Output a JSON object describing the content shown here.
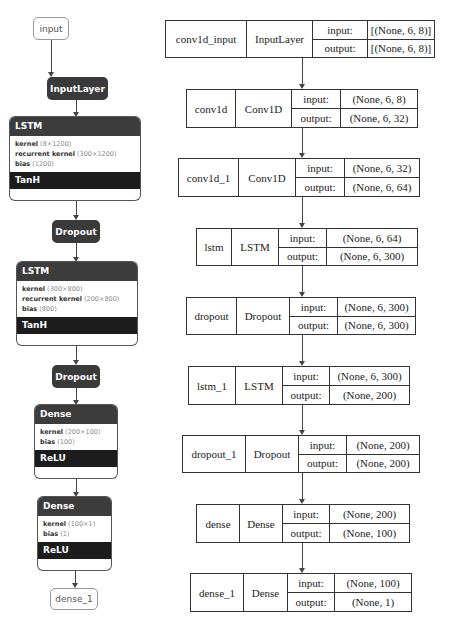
{
  "left_graph": {
    "input_node": "input",
    "input_layer": "InputLayer",
    "lstm1": {
      "title": "LSTM",
      "params": [
        {
          "name": "kernel",
          "shape": "(8×1200)"
        },
        {
          "name": "recurrent kernel",
          "shape": "(300×1200)"
        },
        {
          "name": "bias",
          "shape": "(1200)"
        }
      ],
      "activation": "TanH"
    },
    "dropout1": "Dropout",
    "lstm2": {
      "title": "LSTM",
      "params": [
        {
          "name": "kernel",
          "shape": "(300×800)"
        },
        {
          "name": "recurrent kernel",
          "shape": "(200×800)"
        },
        {
          "name": "bias",
          "shape": "(800)"
        }
      ],
      "activation": "TanH"
    },
    "dropout2": "Dropout",
    "dense1": {
      "title": "Dense",
      "params": [
        {
          "name": "kernel",
          "shape": "(200×100)"
        },
        {
          "name": "bias",
          "shape": "(100)"
        }
      ],
      "activation": "ReLU"
    },
    "dense2": {
      "title": "Dense",
      "params": [
        {
          "name": "kernel",
          "shape": "(100×1)"
        },
        {
          "name": "bias",
          "shape": "(1)"
        }
      ],
      "activation": "ReLU"
    },
    "output_node": "dense_1"
  },
  "keras_graph": [
    {
      "name": "conv1d_input",
      "type": "InputLayer",
      "input_label": "input:",
      "output_label": "output:",
      "input": "[(None, 6, 8)]",
      "output": "[(None, 6, 8)]"
    },
    {
      "name": "conv1d",
      "type": "Conv1D",
      "input_label": "input:",
      "output_label": "output:",
      "input": "(None, 6, 8)",
      "output": "(None, 6, 32)"
    },
    {
      "name": "conv1d_1",
      "type": "Conv1D",
      "input_label": "input:",
      "output_label": "output:",
      "input": "(None, 6, 32)",
      "output": "(None, 6, 64)"
    },
    {
      "name": "lstm",
      "type": "LSTM",
      "input_label": "input:",
      "output_label": "output:",
      "input": "(None, 6, 64)",
      "output": "(None, 6, 300)"
    },
    {
      "name": "dropout",
      "type": "Dropout",
      "input_label": "input:",
      "output_label": "output:",
      "input": "(None, 6, 300)",
      "output": "(None, 6, 300)"
    },
    {
      "name": "lstm_1",
      "type": "LSTM",
      "input_label": "input:",
      "output_label": "output:",
      "input": "(None, 6, 300)",
      "output": "(None, 200)"
    },
    {
      "name": "dropout_1",
      "type": "Dropout",
      "input_label": "input:",
      "output_label": "output:",
      "input": "(None, 200)",
      "output": "(None, 200)"
    },
    {
      "name": "dense",
      "type": "Dense",
      "input_label": "input:",
      "output_label": "output:",
      "input": "(None, 200)",
      "output": "(None, 100)"
    },
    {
      "name": "dense_1",
      "type": "Dense",
      "input_label": "input:",
      "output_label": "output:",
      "input": "(None, 100)",
      "output": "(None, 1)"
    }
  ]
}
